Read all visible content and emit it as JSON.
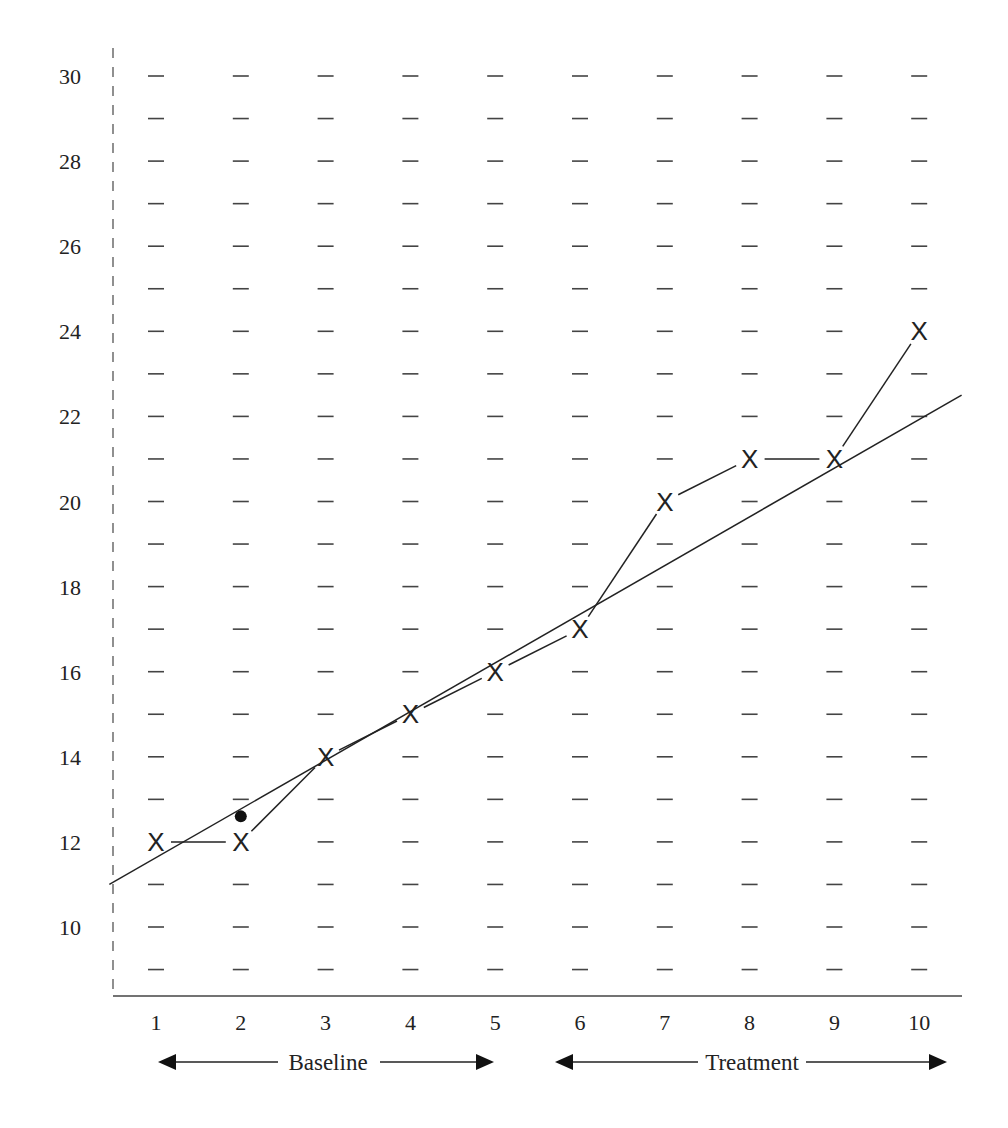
{
  "chart_data": {
    "type": "line",
    "title": "",
    "xlabel": "",
    "ylabel": "",
    "x": [
      1,
      2,
      3,
      4,
      5,
      6,
      7,
      8,
      9,
      10
    ],
    "series": [
      {
        "name": "Observed",
        "marker": "X",
        "values": [
          12,
          12,
          14,
          15,
          16,
          17,
          20,
          21,
          21,
          24
        ]
      }
    ],
    "trend_line": {
      "name": "Baseline trend (extended)",
      "start": {
        "x": 0.45,
        "y": 11.0
      },
      "end": {
        "x": 10.5,
        "y": 22.5
      }
    },
    "marked_point": {
      "x": 2,
      "y": 12.6,
      "marker": "filled-circle"
    },
    "y_ticks": [
      10,
      12,
      14,
      16,
      18,
      20,
      22,
      24,
      26,
      28,
      30
    ],
    "x_ticks": [
      1,
      2,
      3,
      4,
      5,
      6,
      7,
      8,
      9,
      10
    ],
    "ylim": [
      9,
      30
    ],
    "xlim": [
      0.5,
      10.5
    ],
    "grid": "dash markers at every integer y for each x",
    "phases": [
      {
        "label": "Baseline",
        "x_start": 1,
        "x_end": 5
      },
      {
        "label": "Treatment",
        "x_start": 6,
        "x_end": 10
      }
    ],
    "legend": "none"
  },
  "axes": {
    "y_tick_labels": [
      "30",
      "28",
      "26",
      "24",
      "22",
      "20",
      "18",
      "16",
      "14",
      "12",
      "10"
    ],
    "x_tick_labels": [
      "1",
      "2",
      "3",
      "4",
      "5",
      "6",
      "7",
      "8",
      "9",
      "10"
    ]
  },
  "phases": {
    "baseline_label": "Baseline",
    "treatment_label": "Treatment"
  },
  "marker_glyph": "X",
  "colors": {
    "ink": "#222222",
    "axis": "#555555",
    "grid": "#444444"
  }
}
